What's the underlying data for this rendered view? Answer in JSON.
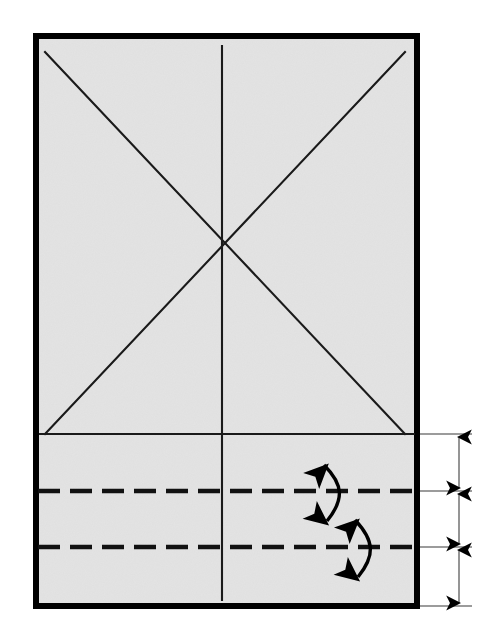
{
  "figure": {
    "type": "technical-line-drawing",
    "canvas": {
      "width": 485,
      "height": 644,
      "background": "#ffffff"
    }
  },
  "colors": {
    "paper_fill": "#e3e3e3",
    "border_stroke": "#000000",
    "crease_stroke": "#1a1a1a",
    "fold_line_stroke": "#111111",
    "dimension_stroke": "#6e6e6e",
    "arrow_fill": "#000000"
  },
  "sheet": {
    "name": "paper-sheet",
    "x": 33,
    "y": 33,
    "width": 387,
    "height": 576,
    "border_width": 6,
    "fill": "#e3e3e3"
  },
  "construction_lines": {
    "diagonals": [
      {
        "name": "diagonal-top-left-to-bottom-right",
        "x1": 45,
        "y1": 52,
        "x2": 405,
        "y2": 434
      },
      {
        "name": "diagonal-bottom-left-to-top-right",
        "x1": 45,
        "y1": 434,
        "x2": 405,
        "y2": 52
      }
    ],
    "vertical_center": {
      "name": "vertical-center-line",
      "x1": 222,
      "y1": 46,
      "x2": 222,
      "y2": 600
    },
    "horizontal_reference": {
      "name": "horizontal-reference-line",
      "x1": 40,
      "y1": 434,
      "x2": 414,
      "y2": 434
    },
    "intersection_point": {
      "x": 222,
      "y": 243
    }
  },
  "fold_lines": [
    {
      "name": "fold-line-upper",
      "y": 491,
      "x1": 38,
      "x2": 416,
      "style": "dashed",
      "dash": "22 10"
    },
    {
      "name": "fold-line-lower",
      "y": 547,
      "x1": 38,
      "x2": 416,
      "style": "dashed",
      "dash": "22 10"
    }
  ],
  "fold_arrows": [
    {
      "name": "fold-arrow-upper",
      "type": "curved-double-headed",
      "about_line": "fold-line-upper"
    },
    {
      "name": "fold-arrow-lower",
      "type": "curved-double-headed",
      "about_line": "fold-line-lower"
    }
  ],
  "dimensions": {
    "extension_lines": [
      {
        "name": "extension-line-top",
        "y": 434,
        "x1": 420,
        "x2": 472
      },
      {
        "name": "extension-line-middle-upper",
        "y": 491,
        "x1": 420,
        "x2": 472
      },
      {
        "name": "extension-line-middle-lower",
        "y": 547,
        "x1": 420,
        "x2": 472
      },
      {
        "name": "extension-line-bottom",
        "y": 606,
        "x1": 420,
        "x2": 472
      }
    ],
    "measures": [
      {
        "name": "dimension-segment-upper",
        "axis_x": 459,
        "from_y": 434,
        "to_y": 491,
        "label": ""
      },
      {
        "name": "dimension-segment-middle",
        "axis_x": 459,
        "from_y": 491,
        "to_y": 547,
        "label": ""
      },
      {
        "name": "dimension-segment-lower",
        "axis_x": 459,
        "from_y": 547,
        "to_y": 606,
        "label": ""
      }
    ]
  }
}
